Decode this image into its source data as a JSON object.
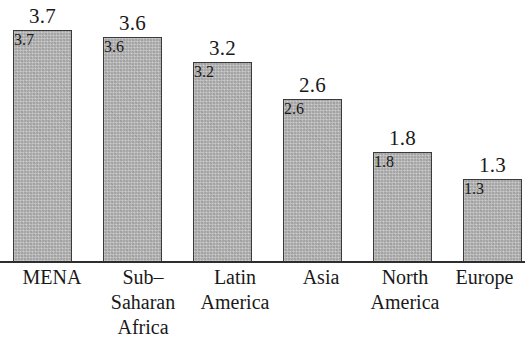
{
  "chart_data": {
    "type": "bar",
    "title": "",
    "subtitle": "",
    "xlabel": "",
    "ylabel": "",
    "categories": [
      "MENA",
      "Sub–Saharan Africa",
      "Latin America",
      "Asia",
      "North America",
      "Europe"
    ],
    "category_lines": [
      [
        "MENA"
      ],
      [
        "Sub–",
        "Saharan",
        "Africa"
      ],
      [
        "Latin",
        "America"
      ],
      [
        "Asia"
      ],
      [
        "North",
        "America"
      ],
      [
        "Europe"
      ]
    ],
    "values": [
      3.7,
      3.6,
      3.2,
      2.6,
      1.8,
      1.3
    ],
    "value_labels": [
      "3.7",
      "3.6",
      "3.2",
      "2.6",
      "1.8",
      "1.3"
    ],
    "ylim": [
      0,
      4.0
    ],
    "grid": false,
    "legend": null,
    "axis_line_color": "#2e2e2e",
    "bar_fill_color": "#b6b6b6",
    "bar_border_color": "#3b3b3b",
    "text_color": "#191919"
  },
  "layout": {
    "bar_width_px": 59,
    "baseline_y_px": 261,
    "bar_left_px": [
      13,
      103,
      193,
      283,
      373,
      463
    ],
    "bar_top_px": [
      29,
      36,
      61,
      98,
      151,
      178
    ],
    "label_left_px": [
      0,
      88,
      180,
      266,
      350,
      444
    ],
    "label_width_px": [
      104,
      110,
      110,
      110,
      110,
      81
    ]
  }
}
